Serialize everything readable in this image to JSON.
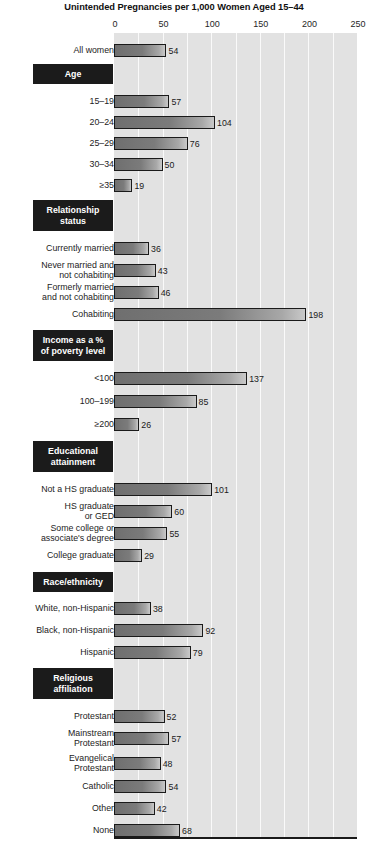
{
  "chart_data": {
    "type": "bar",
    "orientation": "horizontal",
    "title": "Unintended Pregnancies per 1,000 Women Aged 15–44",
    "xlabel": "",
    "ylabel": "",
    "xlim": [
      0,
      250
    ],
    "xticks": [
      0,
      50,
      100,
      150,
      200,
      250
    ],
    "xtick_labels": [
      "0",
      "50",
      "100",
      "150",
      "200",
      "250"
    ],
    "gridlines": "vertical, every 25 units (white on light gray)",
    "legend": "none",
    "categories": [
      "All women",
      "15–19",
      "20–24",
      "25–29",
      "30–34",
      "≥35",
      "Currently married",
      "Never married and not cohabiting",
      "Formerly married and not cohabiting",
      "Cohabiting",
      "<100",
      "100–199",
      "≥200",
      "Not a HS graduate",
      "HS graduate or GED",
      "Some college or associate's degree",
      "College graduate",
      "White, non-Hispanic",
      "Black, non-Hispanic",
      "Hispanic",
      "Protestant",
      "Mainstream Protestant",
      "Evangelical Protestant",
      "Catholic",
      "Other",
      "None"
    ],
    "values": [
      54,
      57,
      104,
      76,
      50,
      19,
      36,
      43,
      46,
      198,
      137,
      85,
      26,
      101,
      60,
      55,
      29,
      38,
      92,
      79,
      52,
      57,
      48,
      54,
      42,
      68
    ],
    "section_headers": [
      "Age",
      "Relationship status",
      "Income as a % of poverty level",
      "Educational attainment",
      "Race/ethnicity",
      "Religious affiliation"
    ]
  },
  "axis": {
    "ticks": [
      {
        "label": "0",
        "value": 0
      },
      {
        "label": "50",
        "value": 50
      },
      {
        "label": "100",
        "value": 100
      },
      {
        "label": "150",
        "value": 150
      },
      {
        "label": "200",
        "value": 200
      },
      {
        "label": "250",
        "value": 250
      }
    ]
  },
  "colors": {
    "plot_background": "#e2e2e2",
    "gridline": "#fafafa",
    "bar_dark": "#6f6f6f",
    "bar_light": "#c9c9c9",
    "bar_border": "#1a1a1a",
    "header_box": "#1b1b1b",
    "header_text": "#ffffff",
    "text": "#1a1a1a",
    "page_background": "#ffffff"
  },
  "rows": [
    {
      "kind": "bar",
      "label": "All women",
      "value": 54,
      "y": 44
    },
    {
      "kind": "header",
      "label": "Age",
      "y": 64,
      "h": 20
    },
    {
      "kind": "bar",
      "label": "15–19",
      "value": 57,
      "y": 95
    },
    {
      "kind": "bar",
      "label": "20–24",
      "value": 104,
      "y": 116
    },
    {
      "kind": "bar",
      "label": "25–29",
      "value": 76,
      "y": 137
    },
    {
      "kind": "bar",
      "label": "30–34",
      "value": 50,
      "y": 158
    },
    {
      "kind": "bar",
      "label": "≥35",
      "value": 19,
      "y": 179
    },
    {
      "kind": "header",
      "label": "Relationship\nstatus",
      "y": 200,
      "h": 31
    },
    {
      "kind": "bar",
      "label": "Currently married",
      "value": 36,
      "y": 242
    },
    {
      "kind": "bar",
      "label": "Never married and\nnot cohabiting",
      "value": 43,
      "y": 264
    },
    {
      "kind": "bar",
      "label": "Formerly married\nand not cohabiting",
      "value": 46,
      "y": 286
    },
    {
      "kind": "bar",
      "label": "Cohabiting",
      "value": 198,
      "y": 308
    },
    {
      "kind": "header",
      "label": "Income as a %\nof poverty level",
      "y": 330,
      "h": 31
    },
    {
      "kind": "bar",
      "label": "<100",
      "value": 137,
      "y": 372
    },
    {
      "kind": "bar",
      "label": "100–199",
      "value": 85,
      "y": 395
    },
    {
      "kind": "bar",
      "label": "≥200",
      "value": 26,
      "y": 418
    },
    {
      "kind": "header",
      "label": "Educational\nattainment",
      "y": 441,
      "h": 31
    },
    {
      "kind": "bar",
      "label": "Not a HS graduate",
      "value": 101,
      "y": 483
    },
    {
      "kind": "bar",
      "label": "HS graduate\nor GED",
      "value": 60,
      "y": 505
    },
    {
      "kind": "bar",
      "label": "Some college or\nassociate's degree",
      "value": 55,
      "y": 527
    },
    {
      "kind": "bar",
      "label": "College graduate",
      "value": 29,
      "y": 549
    },
    {
      "kind": "header",
      "label": "Race/ethnicity",
      "y": 572,
      "h": 20
    },
    {
      "kind": "bar",
      "label": "White, non-Hispanic",
      "value": 38,
      "y": 602
    },
    {
      "kind": "bar",
      "label": "Black, non-Hispanic",
      "value": 92,
      "y": 624
    },
    {
      "kind": "bar",
      "label": "Hispanic",
      "value": 79,
      "y": 646
    },
    {
      "kind": "header",
      "label": "Religious\naffiliation",
      "y": 668,
      "h": 31
    },
    {
      "kind": "bar",
      "label": "Protestant",
      "value": 52,
      "y": 710
    },
    {
      "kind": "bar",
      "label": "Mainstream\nProtestant",
      "value": 57,
      "y": 732
    },
    {
      "kind": "bar",
      "label": "Evangelical\nProtestant",
      "value": 48,
      "y": 757
    },
    {
      "kind": "bar",
      "label": "Catholic",
      "value": 54,
      "y": 780
    },
    {
      "kind": "bar",
      "label": "Other",
      "value": 42,
      "y": 802
    },
    {
      "kind": "bar",
      "label": "None",
      "value": 68,
      "y": 824
    }
  ]
}
